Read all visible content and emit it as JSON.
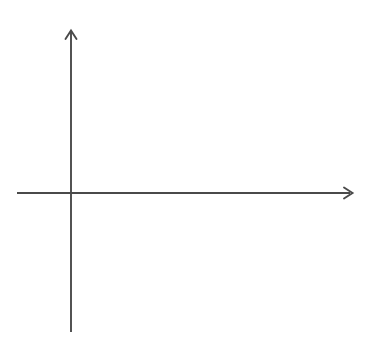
{
  "figure": {
    "type": "blank-coordinate-grid",
    "background_color": "#ffffff",
    "width": 370,
    "height": 351
  },
  "axes": {
    "x_axis_name": "x",
    "y_axis_name": "y",
    "axis_color": "#4a4a4a",
    "grid_color": "#d2d2d2",
    "label_color": "#2b2b2b",
    "origin_px": {
      "x": 71,
      "y": 193
    },
    "unit_px": 27,
    "xlim": [
      -2,
      9.85
    ],
    "ylim": [
      -4.96,
      5.07
    ],
    "grid": "on",
    "grid_style": "dotted",
    "x_arrowhead": true,
    "y_arrowhead": true
  },
  "chart_data": {
    "type": "scatter",
    "title": "",
    "xlabel": "x",
    "ylabel": "y",
    "xlim": [
      -2,
      9.85
    ],
    "ylim": [
      -4.96,
      5.07
    ],
    "grid": true,
    "legend": "none",
    "series": [],
    "x_tick_labels": [
      "-1",
      "1",
      "2",
      "3",
      "4",
      "5",
      "6",
      "7",
      "8",
      "9"
    ],
    "x_tick_values": [
      -1,
      1,
      2,
      3,
      4,
      5,
      6,
      7,
      8,
      9
    ],
    "y_tick_labels": [
      "4",
      "3",
      "2",
      "1",
      "-1",
      "-2",
      "-3",
      "-4"
    ],
    "y_tick_values": [
      4,
      3,
      2,
      1,
      -1,
      -2,
      -3,
      -4
    ]
  },
  "x_ticks": [
    {
      "label": "-1",
      "value": -1
    },
    {
      "label": "1",
      "value": 1
    },
    {
      "label": "2",
      "value": 2
    },
    {
      "label": "3",
      "value": 3
    },
    {
      "label": "4",
      "value": 4
    },
    {
      "label": "5",
      "value": 5
    },
    {
      "label": "6",
      "value": 6
    },
    {
      "label": "7",
      "value": 7
    },
    {
      "label": "8",
      "value": 8
    },
    {
      "label": "9",
      "value": 9
    }
  ],
  "y_ticks": [
    {
      "label": "4",
      "value": 4
    },
    {
      "label": "3",
      "value": 3
    },
    {
      "label": "2",
      "value": 2
    },
    {
      "label": "1",
      "value": 1
    },
    {
      "label": "-1",
      "value": -1
    },
    {
      "label": "-2",
      "value": -2
    },
    {
      "label": "-3",
      "value": -3
    },
    {
      "label": "-4",
      "value": -4
    }
  ]
}
